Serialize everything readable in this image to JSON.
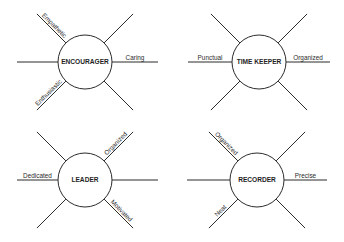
{
  "diagrams": [
    {
      "id": "encourager",
      "title": "ENCOURAGER",
      "center": [
        85,
        62
      ],
      "radius": 27,
      "horizontal": {
        "left": 17,
        "right": 158
      },
      "diagonal_reach": 29,
      "labels": {
        "upper_left": "Empathetic",
        "upper_right": "",
        "left": "",
        "right": "Caring",
        "lower_left": "Enthusiastic",
        "lower_right": ""
      }
    },
    {
      "id": "time-keeper",
      "title": "TIME KEEPER",
      "center": [
        259,
        62
      ],
      "radius": 27,
      "horizontal": {
        "left": 188,
        "right": 330
      },
      "diagonal_reach": 29,
      "labels": {
        "upper_left": "",
        "upper_right": "",
        "left": "Punctual",
        "right": "Organized",
        "lower_left": "",
        "lower_right": ""
      }
    },
    {
      "id": "leader",
      "title": "LEADER",
      "center": [
        85,
        180
      ],
      "radius": 27,
      "horizontal": {
        "left": 17,
        "right": 158
      },
      "diagonal_reach": 29,
      "labels": {
        "upper_left": "",
        "upper_right": "Organized",
        "left": "Dedicated",
        "right": "",
        "lower_left": "",
        "lower_right": "Motivated"
      }
    },
    {
      "id": "recorder",
      "title": "RECORDER",
      "center": [
        257,
        180
      ],
      "radius": 27,
      "horizontal": {
        "left": 187,
        "right": 327
      },
      "diagonal_reach": 29,
      "labels": {
        "upper_left": "Organized",
        "upper_right": "",
        "left": "",
        "right": "Precise",
        "lower_left": "Neat",
        "lower_right": ""
      }
    }
  ],
  "style": {
    "line_color": "#2b2b2b",
    "text_color": "#1f1f1f",
    "background": "#ffffff"
  }
}
